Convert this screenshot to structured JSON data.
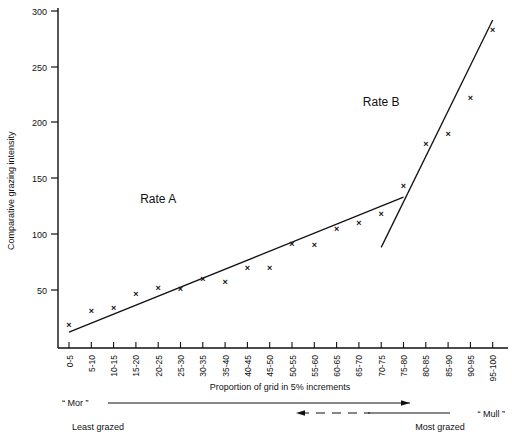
{
  "chart_data": {
    "type": "scatter",
    "title": "",
    "xlabel": "Proportion of grid in 5% increments",
    "ylabel": "Comparative grazing intensity",
    "ylim": [
      0,
      300
    ],
    "yticks": [
      0,
      50,
      100,
      150,
      200,
      250,
      300
    ],
    "ytick_labels": [
      "",
      "50",
      "100",
      "150",
      "200",
      "250",
      "300"
    ],
    "grid": false,
    "legend_position": "inline-annotation",
    "categories": [
      "0-5",
      "5-10",
      "10-15",
      "15-20",
      "20-25",
      "25-30",
      "30-35",
      "35-40",
      "40-45",
      "45-50",
      "50-55",
      "55-60",
      "60-65",
      "65-70",
      "70-75",
      "75-80",
      "80-85",
      "85-90",
      "90-95",
      "95-100"
    ],
    "values": [
      19,
      31,
      34,
      46,
      52,
      51,
      60,
      57,
      70,
      70,
      91,
      90,
      105,
      110,
      118,
      143,
      181,
      190,
      222,
      283
    ],
    "marker": "x",
    "annotations": [
      {
        "text": "Rate A",
        "x_category": "20-25",
        "value": 128
      },
      {
        "text": "Rate B",
        "x_category": "70-75",
        "value": 215
      }
    ],
    "series": [
      {
        "name": "Rate A",
        "type": "trendline",
        "x_start_category": "0-5",
        "x_end_category": "75-80",
        "y_start": 12,
        "y_end": 133
      },
      {
        "name": "Rate B",
        "type": "trendline",
        "x_start_category": "70-75",
        "x_end_category": "95-100",
        "y_start": 88,
        "y_end": 292
      }
    ]
  },
  "axes": {
    "y_title": "Comparative grazing intensity",
    "x_title": "Proportion of grid in 5% increments",
    "y_tick_300": "300",
    "y_tick_250": "250",
    "y_tick_200": "200",
    "y_tick_150": "150",
    "y_tick_100": "100",
    "y_tick_50": "50"
  },
  "footer": {
    "mor_label": "“ Mor ”",
    "mull_label": "“ Mull ”",
    "least_grazed": "Least grazed",
    "most_grazed": "Most grazed"
  },
  "colors": {
    "ink": "#111111",
    "background": "#ffffff"
  }
}
